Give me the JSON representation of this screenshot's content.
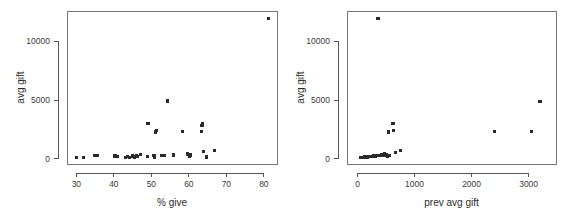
{
  "figure": {
    "background_color": "#ffffff",
    "point_color": "#2a2a2a",
    "axis_color": "#555555",
    "frame_color": "#777777",
    "panel_count": 2
  },
  "chart_data": [
    {
      "type": "scatter",
      "title": "",
      "xlabel": "% give",
      "ylabel": "avg gift",
      "xlim": [
        27.5,
        83.5
      ],
      "ylim": [
        -450,
        12600
      ],
      "xticks": [
        30,
        40,
        50,
        60,
        70,
        80
      ],
      "yticks": [
        0,
        5000,
        10000
      ],
      "xtick_labels": [
        "30",
        "40",
        "50",
        "60",
        "70",
        "80"
      ],
      "ytick_labels": [
        "0",
        "5000",
        "10000"
      ],
      "grid": false,
      "legend": false,
      "marker": "square",
      "points": [
        {
          "x": 30.1,
          "y": 110
        },
        {
          "x": 31.9,
          "y": 120
        },
        {
          "x": 34.8,
          "y": 260
        },
        {
          "x": 35.6,
          "y": 280
        },
        {
          "x": 40.3,
          "y": 240
        },
        {
          "x": 41.0,
          "y": 200
        },
        {
          "x": 43.0,
          "y": 130
        },
        {
          "x": 43.6,
          "y": 190
        },
        {
          "x": 44.2,
          "y": 120
        },
        {
          "x": 44.9,
          "y": 230
        },
        {
          "x": 45.4,
          "y": 140
        },
        {
          "x": 46.0,
          "y": 230
        },
        {
          "x": 46.4,
          "y": 190
        },
        {
          "x": 47.2,
          "y": 330
        },
        {
          "x": 49.0,
          "y": 160
        },
        {
          "x": 49.1,
          "y": 2990
        },
        {
          "x": 50.7,
          "y": 300
        },
        {
          "x": 50.8,
          "y": 120
        },
        {
          "x": 51.2,
          "y": 2280
        },
        {
          "x": 51.3,
          "y": 2420
        },
        {
          "x": 52.6,
          "y": 290
        },
        {
          "x": 53.4,
          "y": 300
        },
        {
          "x": 54.2,
          "y": 4920
        },
        {
          "x": 56.0,
          "y": 320
        },
        {
          "x": 58.3,
          "y": 2310
        },
        {
          "x": 59.7,
          "y": 400
        },
        {
          "x": 60.2,
          "y": 200
        },
        {
          "x": 60.4,
          "y": 310
        },
        {
          "x": 63.3,
          "y": 2310
        },
        {
          "x": 63.5,
          "y": 2840
        },
        {
          "x": 63.6,
          "y": 2980
        },
        {
          "x": 63.9,
          "y": 640
        },
        {
          "x": 64.8,
          "y": 150
        },
        {
          "x": 66.9,
          "y": 680
        },
        {
          "x": 81.2,
          "y": 11950
        }
      ]
    },
    {
      "type": "scatter",
      "title": "",
      "xlabel": "prev avg gift",
      "ylabel": "avg gift",
      "xlim": [
        -185,
        3480
      ],
      "ylim": [
        -450,
        12600
      ],
      "xticks": [
        0,
        1000,
        2000,
        3000
      ],
      "yticks": [
        0,
        5000,
        10000
      ],
      "xtick_labels": [
        "0",
        "1000",
        "2000",
        "3000"
      ],
      "ytick_labels": [
        "0",
        "5000",
        "10000"
      ],
      "grid": false,
      "legend": false,
      "marker": "square",
      "points": [
        {
          "x": 60,
          "y": 110
        },
        {
          "x": 80,
          "y": 120
        },
        {
          "x": 100,
          "y": 130
        },
        {
          "x": 120,
          "y": 140
        },
        {
          "x": 140,
          "y": 120
        },
        {
          "x": 155,
          "y": 160
        },
        {
          "x": 170,
          "y": 150
        },
        {
          "x": 185,
          "y": 170
        },
        {
          "x": 200,
          "y": 190
        },
        {
          "x": 215,
          "y": 180
        },
        {
          "x": 230,
          "y": 200
        },
        {
          "x": 250,
          "y": 210
        },
        {
          "x": 265,
          "y": 200
        },
        {
          "x": 280,
          "y": 230
        },
        {
          "x": 295,
          "y": 240
        },
        {
          "x": 310,
          "y": 230
        },
        {
          "x": 330,
          "y": 260
        },
        {
          "x": 345,
          "y": 250
        },
        {
          "x": 360,
          "y": 11950
        },
        {
          "x": 380,
          "y": 290
        },
        {
          "x": 400,
          "y": 280
        },
        {
          "x": 430,
          "y": 330
        },
        {
          "x": 450,
          "y": 300
        },
        {
          "x": 470,
          "y": 400
        },
        {
          "x": 490,
          "y": 340
        },
        {
          "x": 505,
          "y": 310
        },
        {
          "x": 520,
          "y": 200
        },
        {
          "x": 545,
          "y": 2280
        },
        {
          "x": 560,
          "y": 290
        },
        {
          "x": 620,
          "y": 2990
        },
        {
          "x": 625,
          "y": 2420
        },
        {
          "x": 670,
          "y": 560
        },
        {
          "x": 750,
          "y": 680
        },
        {
          "x": 2400,
          "y": 2310
        },
        {
          "x": 3050,
          "y": 2310
        },
        {
          "x": 3200,
          "y": 4900
        }
      ]
    }
  ]
}
